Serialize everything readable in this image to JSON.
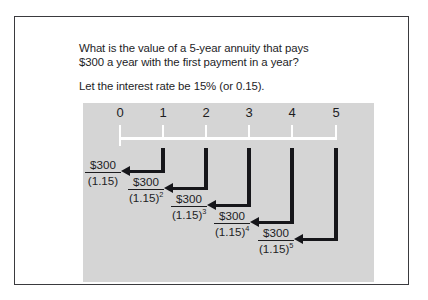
{
  "figure": {
    "prompt": {
      "line1": "What is the value of a 5-year annuity that pays",
      "line2": "$300 a year with the first payment in a year?",
      "line3": "Let the interest rate be 15% (or 0.15)."
    },
    "timeline": {
      "period_labels": [
        "0",
        "1",
        "2",
        "3",
        "4",
        "5"
      ],
      "panel_color": "#d5d5d5",
      "rule_color": "#ffffff",
      "arrow_color": "#16161a"
    },
    "cash_flows": [
      {
        "period": "1",
        "numerator": "$300",
        "denominator_base": "(1.15)",
        "denominator_exponent": ""
      },
      {
        "period": "2",
        "numerator": "$300",
        "denominator_base": "(1.15)",
        "denominator_exponent": "2"
      },
      {
        "period": "3",
        "numerator": "$300",
        "denominator_base": "(1.15)",
        "denominator_exponent": "3"
      },
      {
        "period": "4",
        "numerator": "$300",
        "denominator_base": "(1.15)",
        "denominator_exponent": "4"
      },
      {
        "period": "5",
        "numerator": "$300",
        "denominator_base": "(1.15)",
        "denominator_exponent": "5"
      }
    ]
  }
}
